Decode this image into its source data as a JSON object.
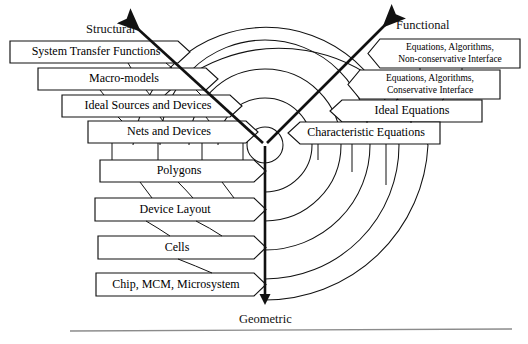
{
  "figure": {
    "type": "y-chart",
    "axes": [
      {
        "id": "structural",
        "label": "Structural",
        "direction": "upper-left"
      },
      {
        "id": "functional",
        "label": "Functional",
        "direction": "upper-right"
      },
      {
        "id": "geometric",
        "label": "Geometric",
        "direction": "down"
      }
    ],
    "center": {
      "x": 265,
      "y": 145
    },
    "arc_radii": [
      18,
      47,
      76,
      105,
      134,
      163
    ]
  },
  "structural_boxes": [
    {
      "label": "System Transfer Functions",
      "x": 10,
      "y": 41,
      "w": 180,
      "h": 22
    },
    {
      "label": "Macro-models",
      "x": 38,
      "y": 68,
      "w": 180,
      "h": 22
    },
    {
      "label": "Ideal Sources and Devices",
      "x": 62,
      "y": 95,
      "w": 180,
      "h": 22
    },
    {
      "label": "Nets and Devices",
      "x": 88,
      "y": 121,
      "w": 180,
      "h": 22
    },
    {
      "label": "Polygons",
      "x": 100,
      "y": 160,
      "w": 180,
      "h": 22
    },
    {
      "label": "Device Layout",
      "x": 95,
      "y": 198,
      "w": 180,
      "h": 23
    },
    {
      "label": "Cells",
      "x": 98,
      "y": 236,
      "w": 180,
      "h": 23
    },
    {
      "label": "Chip, MCM, Microsystem",
      "x": 96,
      "y": 273,
      "w": 180,
      "h": 23
    }
  ],
  "functional_boxes": [
    {
      "lines": [
        "Equations, Algorithms,",
        "Non-conservative Interface"
      ],
      "x": 368,
      "y": 39,
      "w": 152,
      "h": 29
    },
    {
      "lines": [
        "Equations, Algorithms,",
        "Conservative Interface"
      ],
      "x": 348,
      "y": 70,
      "w": 152,
      "h": 29
    },
    {
      "lines": [
        "Ideal Equations"
      ],
      "x": 330,
      "y": 100,
      "w": 152,
      "h": 22
    },
    {
      "lines": [
        "Characteristic Equations"
      ],
      "x": 288,
      "y": 122,
      "w": 152,
      "h": 22
    }
  ],
  "colors": {
    "ink": "#111111",
    "rule": "#8b8b8b",
    "background": "#ffffff"
  },
  "page_rule": {
    "present": true,
    "y": 330,
    "x1": 70,
    "x2": 512
  }
}
